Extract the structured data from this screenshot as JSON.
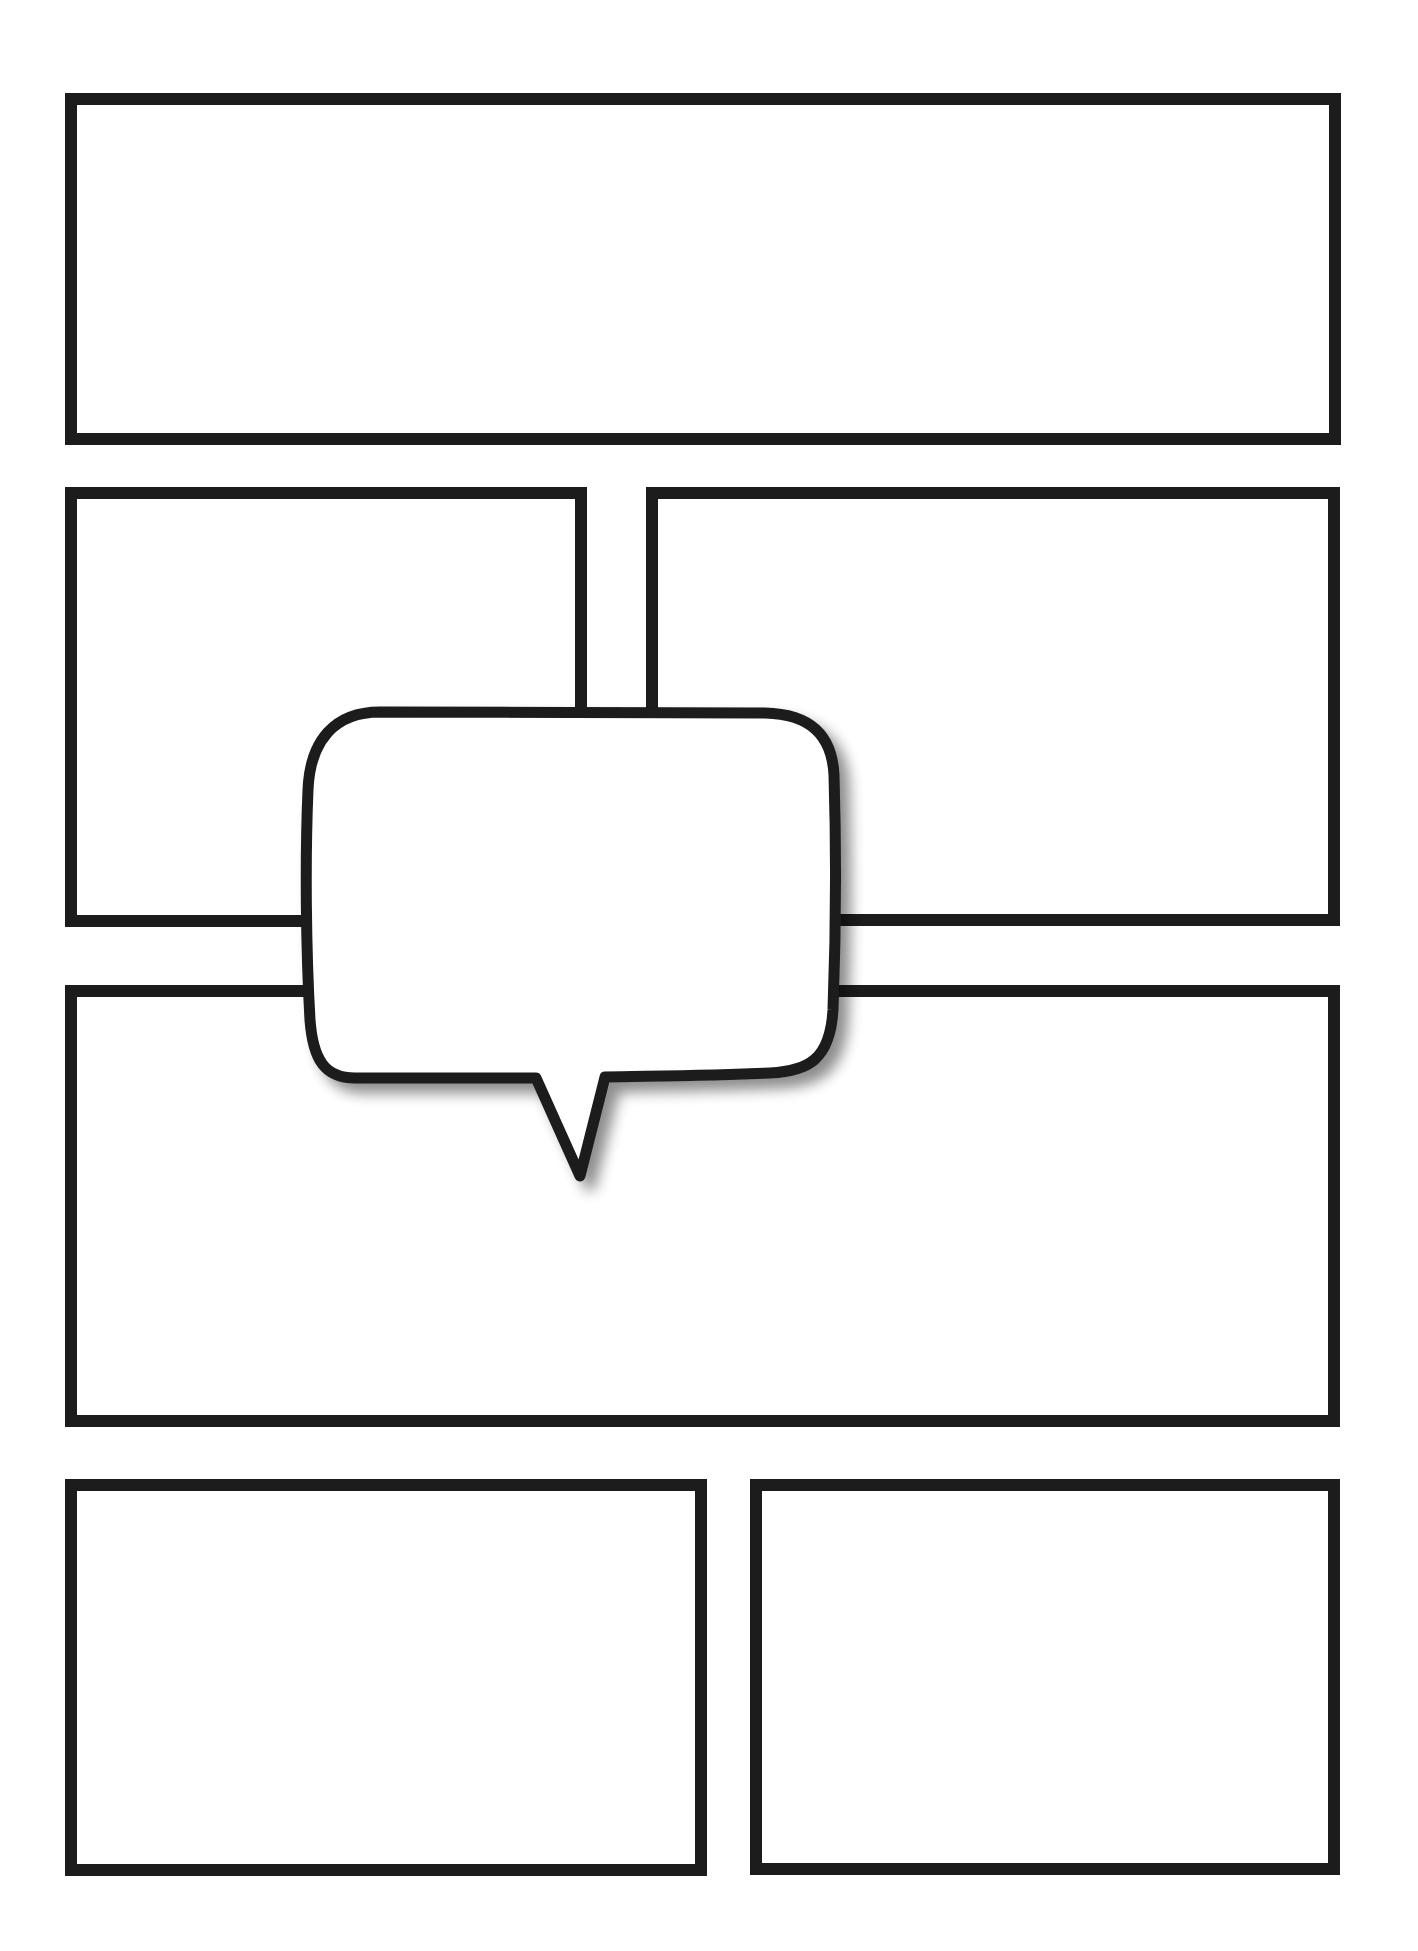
{
  "page": {
    "type": "comic-page-template",
    "background": "#ffffff",
    "border_color": "#1c1c1c",
    "border_width": 12
  },
  "panels": [
    {
      "id": "panel-1",
      "row": 1,
      "x": 65,
      "y": 93,
      "w": 1276,
      "h": 352
    },
    {
      "id": "panel-2",
      "row": 2,
      "x": 65,
      "y": 487,
      "w": 522,
      "h": 440
    },
    {
      "id": "panel-3",
      "row": 2,
      "x": 646,
      "y": 487,
      "w": 694,
      "h": 439
    },
    {
      "id": "panel-4",
      "row": 3,
      "x": 65,
      "y": 985,
      "w": 1275,
      "h": 442
    },
    {
      "id": "panel-5",
      "row": 4,
      "x": 65,
      "y": 1479,
      "w": 642,
      "h": 397
    },
    {
      "id": "panel-6",
      "row": 4,
      "x": 750,
      "y": 1479,
      "w": 590,
      "h": 396
    }
  ],
  "speech_bubble": {
    "text": "",
    "fill": "#ffffff",
    "stroke": "#1c1c1c",
    "tail_direction": "down"
  }
}
